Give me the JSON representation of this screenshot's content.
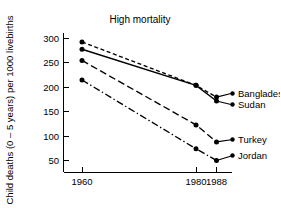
{
  "chart_data": {
    "type": "line",
    "title": "High mortality",
    "xlabel": "",
    "ylabel": "Child deaths (0 – 5 years) per 1000 livebirths",
    "x": [
      1960,
      1980,
      1988
    ],
    "xtick_labels": [
      "1960",
      "1980",
      "1988"
    ],
    "ytick_labels": [
      "50",
      "100",
      "150",
      "200",
      "250",
      "300"
    ],
    "ytick_values": [
      50,
      100,
      150,
      200,
      250,
      300
    ],
    "xlim": [
      1956,
      1992
    ],
    "ylim": [
      20,
      310
    ],
    "grid": false,
    "legend_position": "right-inline-labels",
    "series": [
      {
        "name": "Bangladesh",
        "values": [
          293,
          204,
          180
        ],
        "linestyle": "dashed",
        "marker": "filled-circle"
      },
      {
        "name": "Sudan",
        "values": [
          278,
          204,
          172
        ],
        "linestyle": "solid",
        "marker": "filled-circle"
      },
      {
        "name": "Turkey",
        "values": [
          255,
          123,
          88
        ],
        "linestyle": "long-dash",
        "marker": "filled-circle"
      },
      {
        "name": "Jordan",
        "values": [
          215,
          74,
          50
        ],
        "linestyle": "dash-dot",
        "marker": "filled-circle"
      }
    ]
  }
}
